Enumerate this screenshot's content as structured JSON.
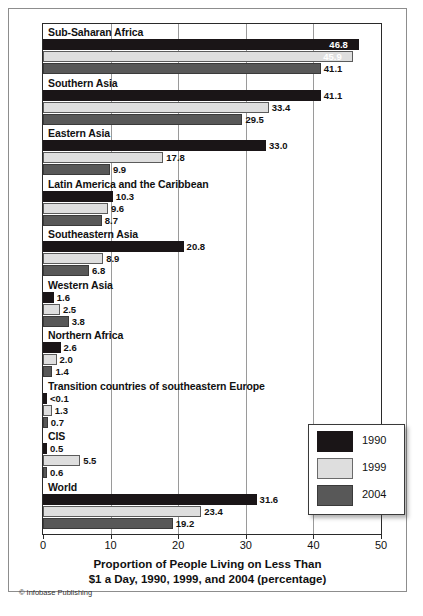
{
  "chart_data": {
    "type": "bar",
    "orientation": "horizontal",
    "title": "",
    "xlabel_line1": "Proportion of People Living on Less Than",
    "xlabel_line2": "$1 a Day, 1990, 1999, and 2004 (percentage)",
    "ylabel": "",
    "xlim": [
      0,
      50
    ],
    "ticks": [
      0,
      10,
      20,
      30,
      40,
      50
    ],
    "tick_labels": [
      "0",
      "10",
      "20",
      "30",
      "40",
      "50"
    ],
    "grid": true,
    "grid_axis": "x",
    "legend_position": "bottom-right",
    "categories": [
      "Sub-Saharan Africa",
      "Southern Asia",
      "Eastern Asia",
      "Latin America and the Caribbean",
      "Southeastern Asia",
      "Western Asia",
      "Northern Africa",
      "Transition countries of southeastern Europe",
      "CIS",
      "World"
    ],
    "series": [
      {
        "name": "1990",
        "color": "#1a1517",
        "values": [
          46.8,
          41.1,
          33.0,
          10.3,
          20.8,
          1.6,
          2.6,
          0.05,
          0.5,
          31.6
        ],
        "labels": [
          "46.8",
          "41.1",
          "33.0",
          "10.3",
          "20.8",
          "1.6",
          "2.6",
          "<0.1",
          "0.5",
          "31.6"
        ]
      },
      {
        "name": "1999",
        "color": "#dedede",
        "values": [
          45.9,
          33.4,
          17.8,
          9.6,
          8.9,
          2.5,
          2.0,
          1.3,
          5.5,
          23.4
        ],
        "labels": [
          "45.9",
          "33.4",
          "17.8",
          "9.6",
          "8.9",
          "2.5",
          "2.0",
          "1.3",
          "5.5",
          "23.4"
        ]
      },
      {
        "name": "2004",
        "color": "#585858",
        "values": [
          41.1,
          29.5,
          9.9,
          8.7,
          6.8,
          3.8,
          1.4,
          0.7,
          0.6,
          19.2
        ],
        "labels": [
          "41.1",
          "29.5",
          "9.9",
          "8.7",
          "6.8",
          "3.8",
          "1.4",
          "0.7",
          "0.6",
          "19.2"
        ]
      }
    ]
  },
  "legend": {
    "items": [
      {
        "label": "1990",
        "color": "#1a1517"
      },
      {
        "label": "1999",
        "color": "#dedede"
      },
      {
        "label": "2004",
        "color": "#585858"
      }
    ]
  },
  "credit": "© Infobase Publishing"
}
